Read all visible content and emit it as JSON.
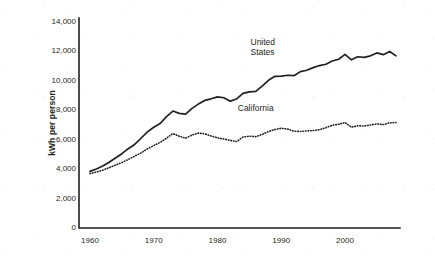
{
  "chart_data": {
    "type": "line",
    "title": "",
    "subtitle": "",
    "xlabel": "",
    "ylabel": "kWh per person",
    "xlim": [
      1960,
      2008
    ],
    "ylim": [
      0,
      14000
    ],
    "grid": false,
    "legend_position": "inline-annotation",
    "x_ticks": [
      "1960",
      "1970",
      "1980",
      "1990",
      "2000"
    ],
    "x_tick_values": [
      1960,
      1970,
      1980,
      1990,
      2000
    ],
    "y_ticks": [
      "0",
      "2,000",
      "4,000",
      "6,000",
      "8,000",
      "10,000",
      "12,000",
      "14,000"
    ],
    "y_tick_values": [
      0,
      2000,
      4000,
      6000,
      8000,
      10000,
      12000,
      14000
    ],
    "x": [
      1960,
      1961,
      1962,
      1963,
      1964,
      1965,
      1966,
      1967,
      1968,
      1969,
      1970,
      1971,
      1972,
      1973,
      1974,
      1975,
      1976,
      1977,
      1978,
      1979,
      1980,
      1981,
      1982,
      1983,
      1984,
      1985,
      1986,
      1987,
      1988,
      1989,
      1990,
      1991,
      1992,
      1993,
      1994,
      1995,
      1996,
      1997,
      1998,
      1999,
      2000,
      2001,
      2002,
      2003,
      2004,
      2005,
      2006,
      2007,
      2008
    ],
    "series": [
      {
        "name": "United States",
        "style": "solid",
        "color": "#231f20",
        "label_x": 1988,
        "label_y": 12600,
        "values": [
          3850,
          4010,
          4220,
          4470,
          4760,
          5050,
          5390,
          5680,
          6100,
          6530,
          6850,
          7100,
          7570,
          7950,
          7790,
          7740,
          8130,
          8420,
          8670,
          8780,
          8910,
          8850,
          8620,
          8770,
          9150,
          9250,
          9280,
          9640,
          10040,
          10310,
          10320,
          10380,
          10350,
          10630,
          10720,
          10900,
          11040,
          11130,
          11350,
          11470,
          11800,
          11430,
          11640,
          11600,
          11700,
          11900,
          11780,
          12000,
          11700
        ]
      },
      {
        "name": "California",
        "style": "dotted",
        "color": "#231f20",
        "label_x": 1986,
        "label_y": 8100,
        "values": [
          3700,
          3800,
          3930,
          4100,
          4280,
          4450,
          4660,
          4880,
          5100,
          5380,
          5600,
          5820,
          6100,
          6420,
          6240,
          6100,
          6320,
          6450,
          6400,
          6250,
          6130,
          6050,
          5950,
          5880,
          6180,
          6240,
          6210,
          6360,
          6560,
          6690,
          6780,
          6720,
          6580,
          6560,
          6600,
          6620,
          6680,
          6820,
          6980,
          7050,
          7170,
          6850,
          6950,
          6930,
          7000,
          7070,
          7030,
          7150,
          7170
        ]
      }
    ]
  },
  "annotations": {
    "united_states_label": "United\nStates",
    "california_label": "California"
  }
}
